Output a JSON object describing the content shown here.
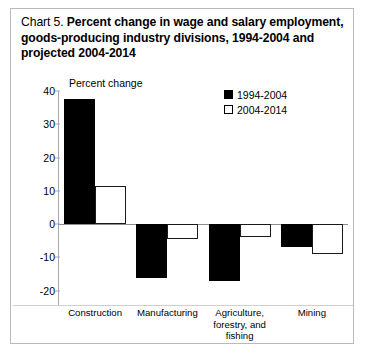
{
  "title": {
    "prefix": "Chart 5.  ",
    "main": "Percent change in wage and salary employment, goods-producing industry divisions, 1994-2004 and projected 2004-2014"
  },
  "axis_caption": "Percent change",
  "legend": {
    "items": [
      {
        "label": "1994-2004",
        "color": "#000000",
        "swatch": "filled-square"
      },
      {
        "label": "2004-2014",
        "color": "#ffffff",
        "swatch": "outlined-square"
      }
    ]
  },
  "ticks": [
    {
      "label": "40",
      "value": 40
    },
    {
      "label": "30",
      "value": 30
    },
    {
      "label": "20",
      "value": 20
    },
    {
      "label": "10",
      "value": 10
    },
    {
      "label": "0",
      "value": 0
    },
    {
      "label": "-10",
      "value": -10
    },
    {
      "label": "-20",
      "value": -20
    }
  ],
  "categories_display": [
    [
      "Construction"
    ],
    [
      "Manufacturing"
    ],
    [
      "Agriculture,",
      "forestry, and",
      "fishing"
    ],
    [
      "Mining"
    ]
  ],
  "chart_data": {
    "type": "bar",
    "title": "Chart 5.  Percent change in wage and salary employment, goods-producing industry divisions, 1994-2004 and projected 2004-2014",
    "xlabel": "",
    "ylabel": "Percent change",
    "ylim": [
      -20,
      40
    ],
    "ytick_step": 10,
    "grid": false,
    "legend_position": "top-right",
    "categories": [
      "Construction",
      "Manufacturing",
      "Agriculture, forestry, and fishing",
      "Mining"
    ],
    "series": [
      {
        "name": "1994-2004",
        "color": "#000000",
        "values": [
          37.5,
          -16.3,
          -17.0,
          -7.0
        ]
      },
      {
        "name": "2004-2014",
        "color": "#ffffff",
        "values": [
          11.5,
          -4.5,
          -4.0,
          -9.0
        ]
      }
    ]
  }
}
